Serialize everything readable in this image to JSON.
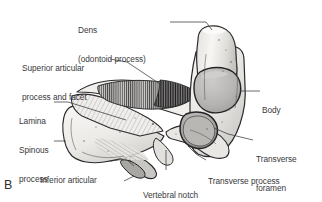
{
  "figure": {
    "panel_letter": "B",
    "background_color": "#ffffff",
    "line_color": "#2a2a2c",
    "text_color": "#39393b",
    "bone_fill_light": "#f4f3f1",
    "bone_fill_mid": "#dcdad7",
    "bone_fill_shadow": "#b8b6b3",
    "articular_surface_fill": "#b5b4b2",
    "foramen_fill": "#9d9b98"
  },
  "labels": [
    {
      "id": "dens",
      "line1": "Dens",
      "line2": "(odontoid process)",
      "left": 78,
      "top": 7,
      "align": "left"
    },
    {
      "id": "superior-articular-process-and-facet",
      "line1": "Superior articular",
      "line2": "process and facet",
      "left": 22,
      "top": 45,
      "align": "left"
    },
    {
      "id": "body",
      "line1": "Body",
      "line2": "",
      "left": 262,
      "top": 87,
      "align": "left"
    },
    {
      "id": "lamina",
      "line1": "Lamina",
      "line2": "",
      "left": 19,
      "top": 98,
      "align": "left"
    },
    {
      "id": "spinous-process",
      "line1": "Spinous",
      "line2": "process",
      "left": 19,
      "top": 127,
      "align": "left"
    },
    {
      "id": "transverse-foramen",
      "line1": "Transverse",
      "line2": "foramen",
      "left": 256,
      "top": 136,
      "align": "left"
    },
    {
      "id": "inferior-articular-process",
      "line1": "Inferior articular",
      "line2": "process",
      "left": 40,
      "top": 157,
      "align": "left"
    },
    {
      "id": "transverse-process",
      "line1": "Transverse process",
      "line2": "",
      "left": 208,
      "top": 158,
      "align": "left"
    },
    {
      "id": "vertebral-notch",
      "line1": "Vertebral notch",
      "line2": "",
      "left": 143,
      "top": 172,
      "align": "left"
    },
    {
      "id": "facet",
      "line1": "Facet",
      "line2": "",
      "left": 107,
      "top": 182,
      "align": "left"
    }
  ]
}
